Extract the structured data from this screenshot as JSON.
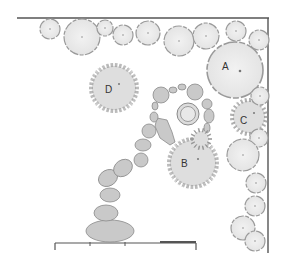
{
  "diagram": {
    "type": "garden-plan",
    "colors": {
      "boundary": "#555555",
      "tree_fill": "#ececec",
      "tree_stroke": "#9a9a9a",
      "shrub_fill": "#dedede",
      "shrub_tick": "#8c8c8c",
      "stone_fill": "#c9c9c9",
      "stone_stroke": "#8a8a8a",
      "center_dot": "#777777"
    },
    "labels": {
      "A": "A",
      "B": "B",
      "C": "C",
      "D": "D"
    },
    "trees": [
      {
        "cx": 50,
        "cy": 29,
        "r": 10
      },
      {
        "cx": 82,
        "cy": 37,
        "r": 18
      },
      {
        "cx": 105,
        "cy": 28,
        "r": 8
      },
      {
        "cx": 123,
        "cy": 35,
        "r": 10
      },
      {
        "cx": 148,
        "cy": 33,
        "r": 12
      },
      {
        "cx": 179,
        "cy": 41,
        "r": 15
      },
      {
        "cx": 206,
        "cy": 36,
        "r": 13
      },
      {
        "cx": 236,
        "cy": 31,
        "r": 10
      },
      {
        "cx": 259,
        "cy": 40,
        "r": 10
      },
      {
        "cx": 235,
        "cy": 70,
        "r": 28,
        "label": "A"
      },
      {
        "cx": 260,
        "cy": 96,
        "r": 9
      },
      {
        "cx": 259,
        "cy": 138,
        "r": 9
      },
      {
        "cx": 243,
        "cy": 155,
        "r": 16
      },
      {
        "cx": 256,
        "cy": 183,
        "r": 10
      },
      {
        "cx": 255,
        "cy": 206,
        "r": 10
      },
      {
        "cx": 243,
        "cy": 228,
        "r": 12
      },
      {
        "cx": 255,
        "cy": 241,
        "r": 10
      }
    ],
    "shrubs": [
      {
        "cx": 114,
        "cy": 88,
        "r": 24,
        "label": "D"
      },
      {
        "cx": 193,
        "cy": 163,
        "r": 25,
        "label": "B"
      },
      {
        "cx": 249,
        "cy": 117,
        "r": 18,
        "label": "C"
      },
      {
        "cx": 201,
        "cy": 139,
        "r": 10
      }
    ],
    "pond": {
      "cx": 188,
      "cy": 114,
      "r_outer": 11,
      "r_inner": 7
    },
    "boundary": {
      "top_y": 18,
      "top_x1": 17,
      "top_x2": 269,
      "right_x": 268,
      "right_y1": 18,
      "right_y2": 253,
      "bottom_y": 243,
      "bottom_x1": 55,
      "bottom_x2": 196
    }
  }
}
